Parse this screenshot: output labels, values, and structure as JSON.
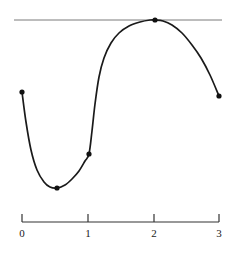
{
  "figure": {
    "background_color": "#ffffff",
    "curve_color": "#1a1a1a",
    "tangent_line_color": "#7a7a7a",
    "axis_color": "#333333",
    "point_color": "#111111"
  },
  "chart_data": {
    "type": "line",
    "title": "",
    "subtitle": "",
    "xlabel": "",
    "ylabel": "",
    "xlim": [
      0,
      3
    ],
    "grid": false,
    "legend": null,
    "annotations": [],
    "axis": {
      "orientation": "horizontal",
      "tick_values": [
        0,
        1,
        2,
        3
      ],
      "tick_labels": [
        "0",
        "1",
        "2",
        "3"
      ],
      "tick_pixels_x": [
        22,
        88,
        154,
        219
      ],
      "axis_pixel_y": 222,
      "tick_direction": "up",
      "tick_length": 8
    },
    "tangent_line": {
      "type": "horizontal",
      "pixel_y": 20,
      "pixel_x_start": 14,
      "pixel_x_end": 222,
      "touches_curve_at": {
        "x": 2.02,
        "pixel_x": 155,
        "pixel_y": 20
      }
    },
    "series": [
      {
        "name": "curve",
        "closed": false,
        "path_points_pixels": [
          [
            22,
            92
          ],
          [
            26,
            122
          ],
          [
            31,
            150
          ],
          [
            37,
            170
          ],
          [
            44,
            182
          ],
          [
            50,
            187
          ],
          [
            57,
            188
          ],
          [
            65,
            185
          ],
          [
            72,
            179
          ],
          [
            79,
            171
          ],
          [
            85,
            161
          ],
          [
            89,
            154
          ],
          [
            92,
            131
          ],
          [
            95,
            104
          ],
          [
            99,
            77
          ],
          [
            104,
            58
          ],
          [
            111,
            43
          ],
          [
            119,
            33
          ],
          [
            129,
            26
          ],
          [
            140,
            22
          ],
          [
            150,
            20
          ],
          [
            155,
            20
          ],
          [
            163,
            21
          ],
          [
            172,
            25
          ],
          [
            182,
            33
          ],
          [
            192,
            45
          ],
          [
            201,
            58
          ],
          [
            210,
            75
          ],
          [
            219,
            96
          ]
        ]
      }
    ],
    "marked_points": [
      {
        "label": "",
        "x": 0.0,
        "pixel_x": 22,
        "pixel_y": 92,
        "role": "left-endpoint"
      },
      {
        "label": "",
        "x": 0.53,
        "pixel_x": 57,
        "pixel_y": 188,
        "role": "local-minimum"
      },
      {
        "label": "",
        "x": 1.02,
        "pixel_x": 89,
        "pixel_y": 154,
        "role": "inflection"
      },
      {
        "label": "",
        "x": 2.02,
        "pixel_x": 155,
        "pixel_y": 20,
        "role": "local-maximum-tangency"
      },
      {
        "label": "",
        "x": 3.0,
        "pixel_x": 219,
        "pixel_y": 96,
        "role": "right-endpoint"
      }
    ],
    "point_radius": 2.6
  }
}
